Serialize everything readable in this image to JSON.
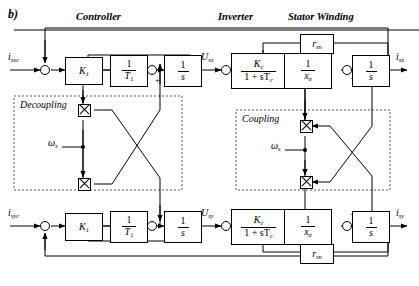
{
  "figure": {
    "label": "b)"
  },
  "sections": [
    {
      "id": "controller",
      "title": "Controller"
    },
    {
      "id": "inverter",
      "title": "Inverter"
    },
    {
      "id": "stator",
      "title": "Stator Winding"
    }
  ],
  "panels": [
    {
      "id": "decoupling",
      "title": "Decoupling"
    },
    {
      "id": "coupling",
      "title": "Coupling"
    }
  ],
  "signals": {
    "input_x": {
      "base": "i",
      "sub": "sxc"
    },
    "input_y": {
      "base": "i",
      "sub": "syc"
    },
    "mid_x": {
      "base": "U",
      "sub": "sx"
    },
    "mid_y": {
      "base": "U",
      "sub": "sy"
    },
    "output_x": {
      "base": "i",
      "sub": "sx"
    },
    "output_y": {
      "base": "i",
      "sub": "sy"
    },
    "omega_top": {
      "base": "ω",
      "sub": "s"
    },
    "omega_bottom": {
      "base": "ω",
      "sub": "s"
    }
  },
  "blocks": {
    "gain_top": {
      "num": "K",
      "sub": "1",
      "kind": "gain"
    },
    "gain_bottom": {
      "num": "K",
      "sub": "1",
      "kind": "gain"
    },
    "tau_top": {
      "num": "1",
      "den": "T",
      "den_sub": "1",
      "kind": "frac"
    },
    "tau_bottom": {
      "num": "1",
      "den": "T",
      "den_sub": "1",
      "kind": "frac"
    },
    "int_c_top": {
      "num": "1",
      "den": "s",
      "kind": "frac"
    },
    "int_c_bottom": {
      "num": "1",
      "den": "s",
      "kind": "frac"
    },
    "inverter_top": {
      "num": "K",
      "num_sub": "c",
      "den": "1 + sT",
      "den_sub": "c",
      "kind": "frac"
    },
    "inverter_bottom": {
      "num": "K",
      "num_sub": "c",
      "den": "1 + sT",
      "den_sub": "c",
      "kind": "frac"
    },
    "xsigma_top": {
      "num": "1",
      "den": "x",
      "den_sub": "σ",
      "kind": "frac"
    },
    "xsigma_bottom": {
      "num": "1",
      "den": "x",
      "den_sub": "σ",
      "kind": "frac"
    },
    "int_s_top": {
      "num": "1",
      "den": "s",
      "kind": "frac"
    },
    "int_s_bottom": {
      "num": "1",
      "den": "s",
      "kind": "frac"
    },
    "r_top": {
      "num": "r",
      "sub": "sn",
      "kind": "gain"
    },
    "r_bottom": {
      "num": "r",
      "sub": "sn",
      "kind": "gain"
    }
  },
  "summing_signs": {
    "ctrl_top_plus": "+",
    "ctrl_bottom_minus": "−",
    "stator_top_inverter_minus": "−",
    "stator_top_int_minus": "−",
    "stator_bottom_inverter_minus": "−",
    "stator_bottom_int_plus": "+"
  },
  "multipliers": [
    {
      "id": "decoupling-mult-upper"
    },
    {
      "id": "decoupling-mult-lower"
    },
    {
      "id": "coupling-mult-upper"
    },
    {
      "id": "coupling-mult-lower"
    }
  ]
}
